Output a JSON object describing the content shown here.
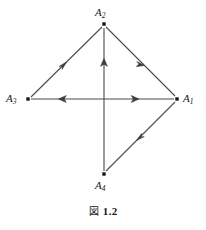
{
  "figure": {
    "caption_prefix": "図",
    "caption_number": "1.2",
    "caption_full": "図 1.2"
  },
  "graph": {
    "type": "directed-graph",
    "stroke_color": "#4a4a4a",
    "vertex_color": "#161616",
    "vertices": [
      {
        "id": "A1",
        "label": "A",
        "subscript": "1",
        "x": 177,
        "y": 99,
        "label_x": 183,
        "label_y": 93
      },
      {
        "id": "A2",
        "label": "A",
        "subscript": "2",
        "x": 104,
        "y": 24,
        "label_x": 95,
        "label_y": 7
      },
      {
        "id": "A3",
        "label": "A",
        "subscript": "3",
        "x": 28,
        "y": 99,
        "label_x": 6,
        "label_y": 93
      },
      {
        "id": "A4",
        "label": "A",
        "subscript": "4",
        "x": 104,
        "y": 174,
        "label_x": 95,
        "label_y": 180
      }
    ],
    "edges": [
      {
        "id": "e-a3-a2",
        "from": "A3",
        "to": "A2",
        "arrow_at": "0.5",
        "description": "A3 to A2"
      },
      {
        "id": "e-a2-a1",
        "from": "A2",
        "to": "A1",
        "arrow_at": "0.5",
        "description": "A2 to A1"
      },
      {
        "id": "e-a1-a4",
        "from": "A1",
        "to": "A4",
        "arrow_at": "0.5",
        "description": "A1 to A4"
      },
      {
        "id": "e-a4-a2",
        "from": "A4",
        "to": "A2",
        "arrow_at": "0.68",
        "description": "A4 to A2"
      },
      {
        "id": "e-a1-a3a",
        "from": "A1",
        "to": "A3",
        "arrow_at": "0.35",
        "description": "A1 to A3 outer arrowhead"
      },
      {
        "id": "e-a1-a3b",
        "from": "A1",
        "to": "A3",
        "arrow_at": "0.68",
        "description": "A1 to A3 inner arrowhead"
      }
    ]
  }
}
